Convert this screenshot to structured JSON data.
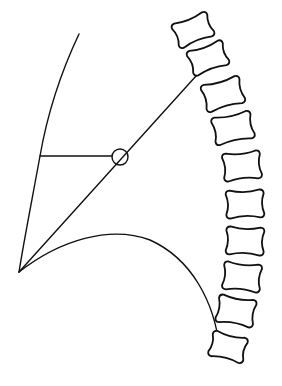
{
  "figure": {
    "title": "",
    "stroke_color": "#111111",
    "background_color": "#ffffff",
    "vertebra_count": 10,
    "caption": ""
  }
}
